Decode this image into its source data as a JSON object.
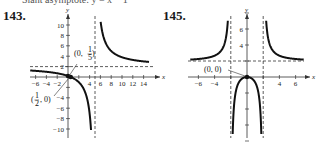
{
  "header": {
    "cutoff_text": "Slant asymptote: y = x − 1"
  },
  "chart_data": [
    {
      "type": "line",
      "problem": "143.",
      "function": "f(x) = (2x - 1)/(x - 5)",
      "xlabel": "x",
      "ylabel": "y",
      "xlim": [
        -7,
        15
      ],
      "ylim": [
        -11,
        11
      ],
      "x_ticks": [
        -6,
        -4,
        -2,
        4,
        6,
        8,
        10,
        12,
        14
      ],
      "y_ticks": [
        -10,
        -8,
        -6,
        -4,
        2,
        4,
        6,
        8,
        10
      ],
      "asymptotes": {
        "vertical": [
          5
        ],
        "horizontal": [
          2
        ]
      },
      "points": [
        {
          "label": "(0, 1/5)",
          "x": 0,
          "y": 0.2
        },
        {
          "label": "(1/2, 0)",
          "x": 0.5,
          "y": 0
        }
      ],
      "grid": false
    },
    {
      "type": "line",
      "problem": "145.",
      "function": "f(x) = 2x^2/(x^2 - 4)",
      "xlabel": "x",
      "ylabel": "y",
      "xlim": [
        -7,
        7
      ],
      "ylim": [
        -8,
        8
      ],
      "x_ticks": [
        -6,
        -4,
        4,
        6
      ],
      "y_ticks": [
        4,
        6
      ],
      "asymptotes": {
        "vertical": [
          -2,
          2
        ],
        "horizontal": [
          2
        ]
      },
      "points": [
        {
          "label": "(0, 0)",
          "x": 0,
          "y": 0
        }
      ],
      "grid": false
    }
  ]
}
